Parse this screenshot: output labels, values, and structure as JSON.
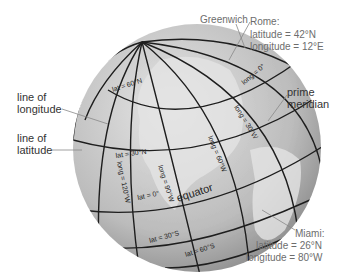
{
  "diagram": {
    "callouts": {
      "greenwich": "Greenwich",
      "rome": {
        "name": "Rome:",
        "latitude": "latitude = 42°N",
        "longitude": "longitude = 12°E"
      },
      "line_of_longitude": [
        "line of",
        "longitude"
      ],
      "line_of_latitude": [
        "line of",
        "latitude"
      ],
      "prime_meridian": [
        "prime",
        "meridian"
      ],
      "miami": {
        "name": "Miami:",
        "latitude": "latitude = 26°N",
        "longitude": "longitude = 80°W"
      }
    },
    "globe_labels": {
      "lat_60n": "lat = 60°N",
      "lat_30n": "lat = 30°N",
      "lat_0": "lat = 0°",
      "lat_30s": "lat = 30°S",
      "lat_60s": "lat = 60°S",
      "long_0": "long = 0°",
      "long_30w": "long = 30°W",
      "long_60w": "long = 60°W",
      "long_90w": "long = 90°W",
      "long_120w": "long = 120°W",
      "equator": "equator"
    },
    "colors": {
      "ocean": "#bdbdbd",
      "land": "#e2e2e2",
      "grid": "#1e1e1e",
      "leader": "#888888"
    }
  }
}
